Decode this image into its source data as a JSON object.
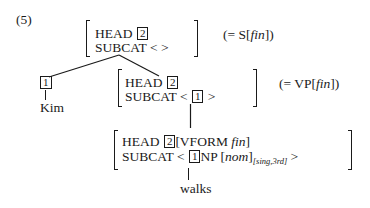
{
  "example_number": "(5)",
  "top_node": {
    "head_label": "HEAD",
    "head_tag": "2",
    "subcat_label": "SUBCAT",
    "subcat_value": "< >",
    "gloss_prefix": "(= S[",
    "gloss_feature": "fin",
    "gloss_suffix": "])"
  },
  "subject_node": {
    "tag": "1",
    "word": "Kim"
  },
  "vp_node": {
    "head_label": "HEAD",
    "head_tag": "2",
    "subcat_label": "SUBCAT",
    "subcat_open": "<",
    "subcat_tag": "1",
    "subcat_close": ">",
    "gloss_prefix": "(= VP[",
    "gloss_feature": "fin",
    "gloss_suffix": "])"
  },
  "lexical_node": {
    "head_label": "HEAD",
    "head_tag": "2",
    "head_value_prefix": "[VFORM ",
    "head_value_feature": "fin",
    "head_value_suffix": "]",
    "subcat_label": "SUBCAT",
    "subcat_open": "<",
    "subcat_tag": "1",
    "subcat_category": "NP",
    "subcat_case_open": "[",
    "subcat_case": "nom",
    "subcat_case_close": "]",
    "subcat_agreement": "[sing,3rd]",
    "subcat_close": ">",
    "word": "walks"
  }
}
